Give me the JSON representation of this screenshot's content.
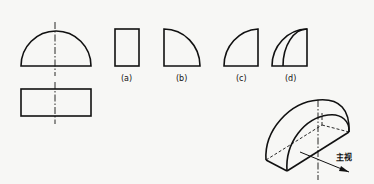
{
  "diagram": {
    "type": "orthographic-projection-exercise",
    "given_views": {
      "front_view": "semicircle",
      "top_view": "rectangle"
    },
    "options": [
      {
        "label": "(a)",
        "shape": "rectangle"
      },
      {
        "label": "(b)",
        "shape": "quarter-circle"
      },
      {
        "label": "(c)",
        "shape": "quarter-circle-mirrored"
      },
      {
        "label": "(d)",
        "shape": "quarter-circle-with-inner-arc"
      }
    ],
    "isometric": {
      "shape": "half-cylinder",
      "direction_label": "主视"
    }
  }
}
